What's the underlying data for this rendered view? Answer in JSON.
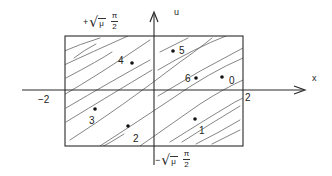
{
  "diagram": {
    "type": "phase-plane sketch with hatched rectangular region",
    "colors": {
      "ink": "#2a2a2a",
      "hatch": "#555555",
      "background": "#ffffff"
    },
    "axes": {
      "horizontal_label": "x",
      "vertical_label": "u",
      "x_ticks": [
        {
          "label": "−2",
          "value": -2
        },
        {
          "label": "2",
          "value": 2
        }
      ]
    },
    "bounds": {
      "upper": {
        "sign": "+",
        "radical": "√",
        "radicand": "μ",
        "numerator": "π",
        "denominator": "2"
      },
      "lower": {
        "sign": "−",
        "radical": "√",
        "radicand": "μ",
        "numerator": "π",
        "denominator": "2"
      }
    },
    "region": {
      "description": "hatched rectangle x∈[−2,2], u∈[−√μ π/2, +√μ π/2]",
      "hatching": "diagonal lines, lower-left to upper-right"
    },
    "points": [
      {
        "label": "0",
        "px": 222,
        "py": 77,
        "lx": 229,
        "ly": 76
      },
      {
        "label": "1",
        "px": 195,
        "py": 119,
        "lx": 199,
        "ly": 126
      },
      {
        "label": "2",
        "px": 128,
        "py": 126,
        "lx": 133,
        "ly": 134
      },
      {
        "label": "3",
        "px": 95,
        "py": 109,
        "lx": 89,
        "ly": 116
      },
      {
        "label": "4",
        "px": 132,
        "py": 63,
        "lx": 118,
        "ly": 56
      },
      {
        "label": "5",
        "px": 173,
        "py": 51,
        "lx": 179,
        "ly": 46
      },
      {
        "label": "6",
        "px": 196,
        "py": 78,
        "lx": 185,
        "ly": 74
      }
    ]
  }
}
